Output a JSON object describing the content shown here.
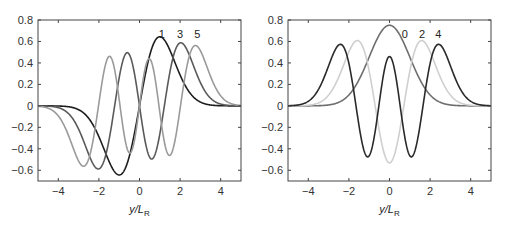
{
  "chart_data": [
    {
      "type": "line",
      "title": "",
      "xlabel": "y/L_R",
      "ylabel": "",
      "xlim": [
        -5,
        5
      ],
      "ylim": [
        -0.7,
        0.8
      ],
      "xticks": [
        -4,
        -2,
        0,
        2,
        4
      ],
      "yticks": [
        -0.6,
        -0.4,
        -0.2,
        0,
        0.2,
        0.4,
        0.6,
        0.8
      ],
      "grid": false,
      "legend": "inline labels near peaks (1, 3, 5)",
      "x": [
        -5,
        -4.5,
        -4,
        -3.5,
        -3,
        -2.5,
        -2,
        -1.5,
        -1,
        -0.5,
        0,
        0.5,
        1,
        1.5,
        2,
        2.5,
        3,
        3.5,
        4,
        4.5,
        5
      ],
      "series": [
        {
          "name": "1",
          "mode": 1,
          "color": "#1e1e1e",
          "label_x": 1.1,
          "label_y": 0.67,
          "values": [
            -0.0,
            -0.0,
            -0.001,
            -0.008,
            -0.035,
            -0.117,
            -0.288,
            -0.517,
            -0.644,
            -0.469,
            0.0,
            0.469,
            0.644,
            0.517,
            0.288,
            0.117,
            0.035,
            0.008,
            0.001,
            0.0,
            0.0
          ]
        },
        {
          "name": "3",
          "mode": 3,
          "color": "#5a5a5a",
          "label_x": 2.0,
          "label_y": 0.67,
          "values": [
            -0.0,
            -0.006,
            -0.031,
            -0.141,
            -0.365,
            -0.583,
            -0.462,
            0.118,
            0.287,
            0.434,
            0.0,
            -0.434,
            -0.287,
            -0.118,
            0.462,
            0.583,
            0.365,
            0.141,
            0.031,
            0.006,
            0.0
          ]
        },
        {
          "name": "5",
          "mode": 5,
          "color": "#9a9a9a",
          "label_x": 2.85,
          "label_y": 0.67,
          "values": [
            -0.006,
            -0.034,
            -0.152,
            -0.404,
            -0.547,
            -0.154,
            0.412,
            -0.44,
            0.051,
            0.327,
            0.0,
            -0.327,
            -0.051,
            0.44,
            -0.412,
            0.154,
            0.547,
            0.404,
            0.152,
            0.034,
            0.006
          ]
        }
      ]
    },
    {
      "type": "line",
      "title": "",
      "xlabel": "y/L_R",
      "ylabel": "",
      "xlim": [
        -5,
        5
      ],
      "ylim": [
        -0.7,
        0.8
      ],
      "xticks": [
        -4,
        -2,
        0,
        2,
        4
      ],
      "yticks": [
        -0.6,
        -0.4,
        -0.2,
        0,
        0.2,
        0.4,
        0.6,
        0.8
      ],
      "grid": false,
      "legend": "inline labels near peaks (0, 2, 4)",
      "x": [
        -5,
        -4.5,
        -4,
        -3.5,
        -3,
        -2.5,
        -2,
        -1.5,
        -1,
        -0.5,
        0,
        0.5,
        1,
        1.5,
        2,
        2.5,
        3,
        3.5,
        4,
        4.5,
        5
      ],
      "series": [
        {
          "name": "0",
          "mode": 0,
          "color": "#6e6e6e",
          "label_x": 0.75,
          "label_y": 0.67,
          "values": [
            0.0,
            0.0,
            0.0,
            0.002,
            0.008,
            0.033,
            0.102,
            0.244,
            0.456,
            0.663,
            0.751,
            0.663,
            0.456,
            0.244,
            0.102,
            0.033,
            0.008,
            0.002,
            0.0,
            0.0,
            0.0
          ]
        },
        {
          "name": "2",
          "mode": 2,
          "color": "#cfcfcf",
          "label_x": 1.6,
          "label_y": 0.67,
          "values": [
            0.0,
            0.002,
            0.011,
            0.043,
            0.16,
            0.295,
            0.506,
            0.595,
            0.172,
            -0.221,
            -0.531,
            -0.221,
            0.172,
            0.595,
            0.506,
            0.295,
            0.16,
            0.043,
            0.011,
            0.002,
            0.0
          ]
        },
        {
          "name": "4",
          "mode": 4,
          "color": "#2a2a2a",
          "label_x": 2.4,
          "label_y": 0.67,
          "values": [
            0.0,
            0.012,
            0.058,
            0.182,
            0.407,
            0.55,
            0.239,
            -0.238,
            -0.458,
            0.049,
            0.46,
            0.049,
            -0.458,
            -0.238,
            0.239,
            0.55,
            0.407,
            0.182,
            0.058,
            0.012,
            0.0
          ]
        }
      ]
    }
  ],
  "panels": [
    {
      "xlabel_main": "y/L",
      "xlabel_sub": "R",
      "curve_labels": [
        "1",
        "3",
        "5"
      ]
    },
    {
      "xlabel_main": "y/L",
      "xlabel_sub": "R",
      "curve_labels": [
        "0",
        "2",
        "4"
      ]
    }
  ]
}
